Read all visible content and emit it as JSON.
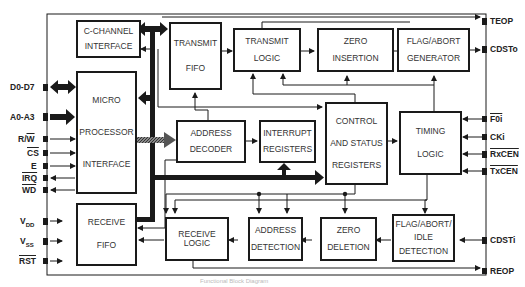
{
  "diagram": {
    "title": "Functional Block Diagram",
    "blocks": {
      "c_channel": [
        "C-CHANNEL",
        "INTERFACE"
      ],
      "transmit_fifo": [
        "TRANSMIT",
        "FIFO"
      ],
      "transmit_logic": [
        "TRANSMIT",
        "LOGIC"
      ],
      "zero_insertion": [
        "ZERO",
        "INSERTION"
      ],
      "flag_abort_gen": [
        "FLAG/ABORT",
        "GENERATOR"
      ],
      "micro_if": [
        "MICRO",
        "PROCESSOR",
        "INTERFACE"
      ],
      "address_decoder": [
        "ADDRESS",
        "DECODER"
      ],
      "interrupt_regs": [
        "INTERRUPT",
        "REGISTERS"
      ],
      "control_status": [
        "CONTROL",
        "AND STATUS",
        "REGISTERS"
      ],
      "timing_logic": [
        "TIMING",
        "LOGIC"
      ],
      "receive_fifo": [
        "RECEIVE",
        "FIFO"
      ],
      "receive_logic": [
        "RECEIVE LOGIC"
      ],
      "address_detection": [
        "ADDRESS",
        "DETECTION"
      ],
      "zero_deletion": [
        "ZERO",
        "DELETION"
      ],
      "flag_abort_idle": [
        "FLAG/ABORT/",
        "IDLE",
        "DETECTION"
      ]
    },
    "pins_left": {
      "d0_d7": "D0-D7",
      "a0_a3": "A0-A3",
      "rw": "R/W",
      "cs": "CS",
      "e": "E",
      "irq": "IRQ",
      "wd": "WD",
      "vdd": "V",
      "vdd_sub": "DD",
      "vss": "V",
      "vss_sub": "SS",
      "rst": "RST"
    },
    "pins_right": {
      "teop": "TEOP",
      "cdsto": "CDSTo",
      "f0i": "F0i",
      "cki": "CKi",
      "rxcen": "RxCEN",
      "txcen": "TxCEN",
      "cdsti": "CDSTi",
      "reop": "REOP"
    },
    "colors": {
      "line": "#1a1a1a",
      "hatched_bus": "#555555"
    }
  }
}
